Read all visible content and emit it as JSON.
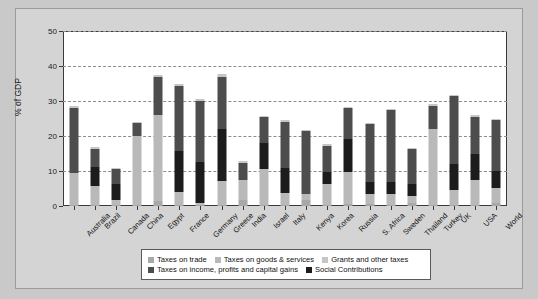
{
  "chart_data": {
    "type": "bar",
    "stacked": true,
    "title": "",
    "xlabel": "",
    "ylabel": "% of GDP",
    "ylim": [
      0,
      50
    ],
    "yticks": [
      0,
      10,
      20,
      30,
      40,
      50
    ],
    "grid": true,
    "legend_position": "bottom",
    "categories": [
      "Australia",
      "Brazil",
      "Canada",
      "China",
      "Egypt",
      "France",
      "Germany",
      "Greece",
      "India",
      "Israel",
      "Italy",
      "Kenya",
      "Korea",
      "Russia",
      "S. Africa",
      "Sweden",
      "Thailand",
      "Turkey",
      "UK",
      "USA",
      "World"
    ],
    "series": [
      {
        "name": "Taxes on trade",
        "color": "#a8a8a8",
        "values": [
          0.2,
          0.4,
          0.3,
          0.3,
          1.5,
          0.2,
          0.2,
          0.2,
          1.6,
          0.3,
          0.2,
          1.8,
          0.4,
          0.6,
          0.6,
          0.2,
          1.0,
          0.3,
          0.2,
          0.2,
          0.8
        ]
      },
      {
        "name": "Taxes on goods & services",
        "color": "#b9b9b9",
        "values": [
          9.3,
          5.2,
          1.3,
          19.7,
          24.5,
          3.9,
          0.8,
          7.0,
          5.8,
          10.4,
          3.5,
          1.6,
          5.9,
          9.2,
          2.8,
          3.3,
          2.0,
          21.7,
          4.3,
          7.3,
          4.3
        ]
      },
      {
        "name": "Grants and other taxes",
        "color": "#c6c6c6",
        "values": [
          0.5,
          0.6,
          0.2,
          0.5,
          0.5,
          0.5,
          0.4,
          0.6,
          0.6,
          0.4,
          0.5,
          0.4,
          0.5,
          0.4,
          0.4,
          0.3,
          0.4,
          0.5,
          0.4,
          0.4,
          0.4
        ]
      },
      {
        "name": "Taxes on income, profits and capital gains",
        "color": "#4d4d4d",
        "values": [
          18.5,
          5.3,
          4.5,
          3.6,
          11.0,
          18.6,
          17.5,
          14.9,
          5.0,
          7.3,
          13.1,
          18.0,
          7.6,
          8.9,
          16.6,
          20.4,
          10.0,
          6.6,
          19.2,
          10.7,
          14.5
        ]
      },
      {
        "name": "Social Contributions",
        "color": "#1c1c1c",
        "values": [
          0.0,
          5.5,
          4.6,
          0.0,
          0.0,
          11.6,
          11.6,
          14.9,
          0.0,
          7.3,
          7.3,
          0.0,
          3.3,
          9.3,
          3.4,
          3.4,
          3.2,
          0.0,
          7.6,
          7.3,
          4.9
        ]
      }
    ],
    "bar_stack_order": [
      "Taxes on trade",
      "Taxes on goods & services",
      "Social Contributions",
      "Taxes on income, profits and capital gains",
      "Grants and other taxes"
    ],
    "totals": [
      28.5,
      25.0,
      20.9,
      24.1,
      37.5,
      44.7,
      30.3,
      43.9,
      14.8,
      45.5,
      38.5,
      21.8,
      25.0,
      37.2,
      30.3,
      41.2,
      22.2,
      29.1,
      38.0,
      18.5,
      25.9
    ]
  },
  "legend": {
    "rows": [
      [
        {
          "label": "Taxes on trade",
          "color": "#a8a8a8"
        },
        {
          "label": "Taxes on goods & services",
          "color": "#b9b9b9"
        },
        {
          "label": "Grants and other taxes",
          "color": "#c6c6c6"
        }
      ],
      [
        {
          "label": "Taxes on income, profits and capital gains",
          "color": "#4d4d4d"
        },
        {
          "label": "Social Contributions",
          "color": "#1c1c1c"
        }
      ]
    ]
  }
}
